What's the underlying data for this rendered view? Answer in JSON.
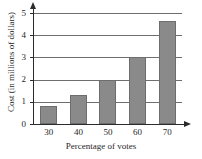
{
  "chart_data": {
    "type": "bar",
    "title": "",
    "xlabel": "Percentage of votes",
    "ylabel": "Cost (in millions of dollars)",
    "categories": [
      "30",
      "40",
      "50",
      "60",
      "70"
    ],
    "values": [
      0.8,
      1.3,
      2.0,
      3.0,
      4.65
    ],
    "ylim": [
      0,
      5
    ],
    "yticks": [
      "0",
      "1",
      "2",
      "3",
      "4",
      "5"
    ],
    "grid": "horizontal",
    "legend": "none",
    "bar_color": "#8a8a8a",
    "axis_color": "#2b2b2b",
    "gridline_color": "#6e6e6e"
  }
}
